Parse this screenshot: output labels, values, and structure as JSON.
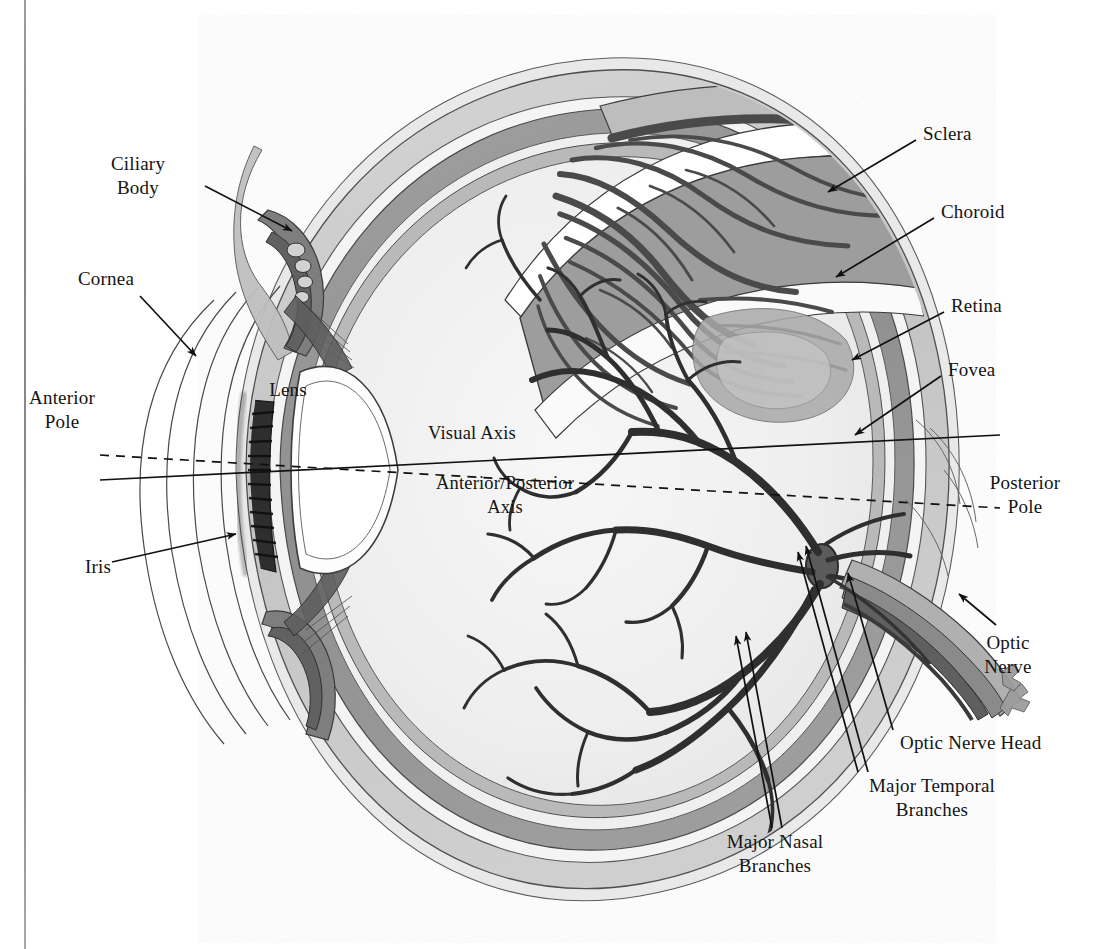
{
  "figure": {
    "kind": "anatomical-illustration",
    "style": "grayscale scanned line-and-wash drawing on white page",
    "page_binding_line": true
  },
  "colors": {
    "page": "#ffffff",
    "ink": "#141414",
    "sclera_band": "#c9c9c9",
    "choroid_band": "#9a9a9a",
    "retina_band": "#b4b4b4",
    "vitreous": "#f2f2f2",
    "vessel_dark": "#3a3a3a",
    "vessel_mid": "#6a6a6a",
    "lens_fill": "#fdfdfd",
    "iris_dark": "#2b2b2b",
    "optic_nerve": "#8e8e8e",
    "leader_line": "#111111"
  },
  "labels": [
    {
      "id": "ciliary-body",
      "text": "Ciliary\nBody",
      "x": 138,
      "y": 163,
      "align": "center"
    },
    {
      "id": "cornea",
      "text": "Cornea",
      "x": 78,
      "y": 278,
      "align": "left"
    },
    {
      "id": "anterior-pole",
      "text": "Anterior\nPole",
      "x": 62,
      "y": 397,
      "align": "center"
    },
    {
      "id": "iris",
      "text": "Iris",
      "x": 85,
      "y": 566,
      "align": "left"
    },
    {
      "id": "lens",
      "text": "Lens",
      "x": 288,
      "y": 389,
      "align": "center"
    },
    {
      "id": "visual-axis",
      "text": "Visual Axis",
      "x": 428,
      "y": 432,
      "align": "left"
    },
    {
      "id": "anterior-posterior-axis",
      "text": "Anterior/Posterior\nAxis",
      "x": 505,
      "y": 482,
      "align": "center"
    },
    {
      "id": "sclera",
      "text": "Sclera",
      "x": 923,
      "y": 133,
      "align": "left"
    },
    {
      "id": "choroid",
      "text": "Choroid",
      "x": 941,
      "y": 211,
      "align": "left"
    },
    {
      "id": "retina",
      "text": "Retina",
      "x": 951,
      "y": 305,
      "align": "left"
    },
    {
      "id": "fovea",
      "text": "Fovea",
      "x": 948,
      "y": 369,
      "align": "left"
    },
    {
      "id": "posterior-pole",
      "text": "Posterior\nPole",
      "x": 1025,
      "y": 482,
      "align": "center"
    },
    {
      "id": "optic-nerve",
      "text": "Optic\nNerve",
      "x": 1008,
      "y": 642,
      "align": "center"
    },
    {
      "id": "optic-nerve-head",
      "text": "Optic Nerve Head",
      "x": 900,
      "y": 742,
      "align": "left"
    },
    {
      "id": "major-temporal-branches",
      "text": "Major Temporal\nBranches",
      "x": 932,
      "y": 785,
      "align": "center"
    },
    {
      "id": "major-nasal-branches",
      "text": "Major Nasal\nBranches",
      "x": 775,
      "y": 841,
      "align": "center"
    }
  ],
  "leaders": [
    {
      "id": "ciliary-body-leader",
      "from": [
        205,
        186
      ],
      "to": [
        292,
        231
      ],
      "arrow": true
    },
    {
      "id": "cornea-leader",
      "from": [
        140,
        296
      ],
      "to": [
        196,
        356
      ],
      "arrow": true
    },
    {
      "id": "anterior-pole-leader",
      "from": [
        100,
        480
      ],
      "to": [
        566,
        437
      ],
      "arrow": false
    },
    {
      "id": "iris-leader",
      "from": [
        112,
        562
      ],
      "to": [
        236,
        534
      ],
      "arrow": true
    },
    {
      "id": "sclera-leader",
      "from": [
        916,
        140
      ],
      "to": [
        828,
        192
      ],
      "arrow": true
    },
    {
      "id": "choroid-leader",
      "from": [
        934,
        218
      ],
      "to": [
        836,
        277
      ],
      "arrow": true
    },
    {
      "id": "retina-leader",
      "from": [
        944,
        312
      ],
      "to": [
        852,
        360
      ],
      "arrow": true
    },
    {
      "id": "fovea-leader",
      "from": [
        941,
        376
      ],
      "to": [
        855,
        435
      ],
      "arrow": true
    },
    {
      "id": "optic-nerve-leader",
      "from": [
        996,
        625
      ],
      "to": [
        959,
        594
      ],
      "arrow": true
    },
    {
      "id": "optic-nerve-head-leader",
      "from": [
        893,
        730
      ],
      "to": [
        848,
        573
      ],
      "arrow": true
    },
    {
      "id": "major-temporal-leader",
      "from": [
        868,
        772
      ],
      "to": [
        806,
        546
      ],
      "arrow": true
    },
    {
      "id": "major-nasal-leader",
      "from": [
        782,
        828
      ],
      "to": [
        746,
        632
      ],
      "arrow": true
    }
  ],
  "axes": [
    {
      "id": "visual-axis-line",
      "style": "solid",
      "from": [
        100,
        480
      ],
      "to": [
        1000,
        435
      ]
    },
    {
      "id": "anterior-posterior-axis-line",
      "style": "dashed",
      "from": [
        100,
        455
      ],
      "to": [
        1000,
        508
      ]
    }
  ],
  "structures": [
    {
      "id": "sclera",
      "label": "Sclera"
    },
    {
      "id": "choroid",
      "label": "Choroid"
    },
    {
      "id": "retina",
      "label": "Retina"
    },
    {
      "id": "fovea",
      "label": "Fovea"
    },
    {
      "id": "cornea",
      "label": "Cornea"
    },
    {
      "id": "iris",
      "label": "Iris"
    },
    {
      "id": "lens",
      "label": "Lens"
    },
    {
      "id": "ciliary-body",
      "label": "Ciliary Body"
    },
    {
      "id": "optic-nerve",
      "label": "Optic Nerve"
    },
    {
      "id": "optic-nerve-head",
      "label": "Optic Nerve Head"
    },
    {
      "id": "major-temporal-branches",
      "label": "Major Temporal Branches"
    },
    {
      "id": "major-nasal-branches",
      "label": "Major Nasal Branches"
    },
    {
      "id": "anterior-pole",
      "label": "Anterior Pole"
    },
    {
      "id": "posterior-pole",
      "label": "Posterior Pole"
    }
  ]
}
